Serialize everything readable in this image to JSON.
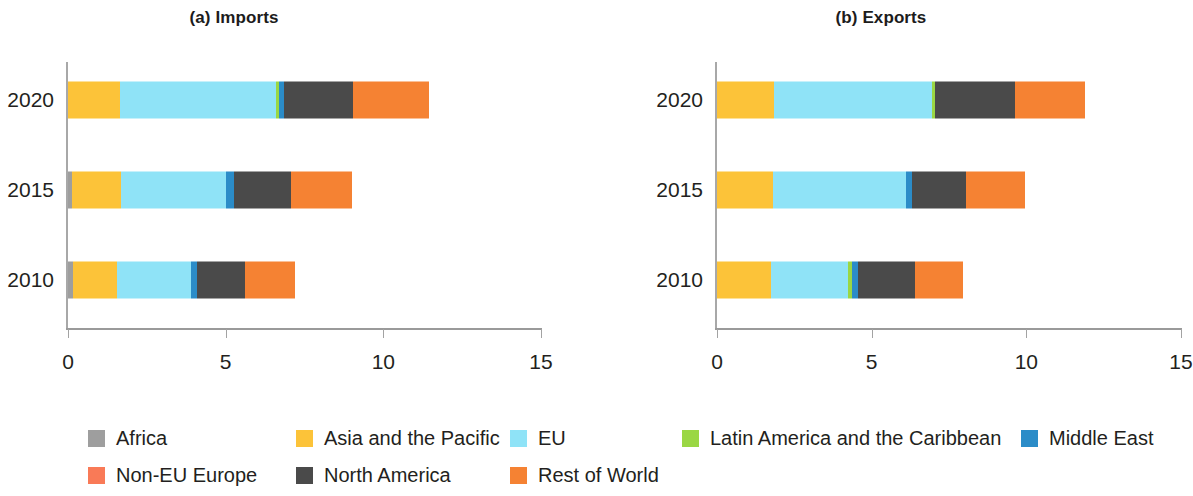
{
  "chart_data": {
    "type": "bar",
    "orientation": "horizontal",
    "stacked": true,
    "title": "",
    "panels": [
      {
        "id": "imports",
        "title": "(a) Imports",
        "xlabel": "",
        "ylabel": "",
        "xlim": [
          0,
          15
        ],
        "xticks": [
          0,
          5,
          10,
          15
        ],
        "xtick_labels": [
          "0",
          "5",
          "10",
          "15"
        ],
        "categories": [
          "2020",
          "2015",
          "2010"
        ],
        "grid": false,
        "series": [
          {
            "name": "Africa",
            "values": [
              0.0,
              0.12,
              0.15
            ]
          },
          {
            "name": "Asia and the Pacific",
            "values": [
              1.65,
              1.55,
              1.4
            ]
          },
          {
            "name": "EU",
            "values": [
              4.95,
              3.35,
              2.35
            ]
          },
          {
            "name": "Latin America and the Caribbean",
            "values": [
              0.1,
              0.0,
              0.0
            ]
          },
          {
            "name": "Middle East",
            "values": [
              0.15,
              0.25,
              0.2
            ]
          },
          {
            "name": "Non-EU Europe",
            "values": [
              0.0,
              0.0,
              0.0
            ]
          },
          {
            "name": "North America",
            "values": [
              2.2,
              1.8,
              1.5
            ]
          },
          {
            "name": "Rest of World",
            "values": [
              2.4,
              1.95,
              1.6
            ]
          }
        ],
        "totals": [
          11.45,
          9.02,
          7.2
        ]
      },
      {
        "id": "exports",
        "title": "(b) Exports",
        "xlabel": "",
        "ylabel": "",
        "xlim": [
          0,
          15
        ],
        "xticks": [
          0,
          5,
          10,
          15
        ],
        "xtick_labels": [
          "0",
          "5",
          "10",
          "15"
        ],
        "categories": [
          "2020",
          "2015",
          "2010"
        ],
        "grid": false,
        "series": [
          {
            "name": "Africa",
            "values": [
              0.0,
              0.0,
              0.0
            ]
          },
          {
            "name": "Asia and the Pacific",
            "values": [
              1.85,
              1.8,
              1.75
            ]
          },
          {
            "name": "EU",
            "values": [
              5.1,
              4.3,
              2.5
            ]
          },
          {
            "name": "Latin America and the Caribbean",
            "values": [
              0.1,
              0.0,
              0.1
            ]
          },
          {
            "name": "Middle East",
            "values": [
              0.0,
              0.2,
              0.2
            ]
          },
          {
            "name": "Non-EU Europe",
            "values": [
              0.0,
              0.0,
              0.0
            ]
          },
          {
            "name": "North America",
            "values": [
              2.6,
              1.75,
              1.85
            ]
          },
          {
            "name": "Rest of World",
            "values": [
              2.25,
              1.9,
              1.55
            ]
          }
        ],
        "totals": [
          11.9,
          9.95,
          7.95
        ]
      }
    ]
  },
  "legend": {
    "position": "bottom",
    "items": [
      {
        "label": "Africa",
        "color": "#9e9e9e"
      },
      {
        "label": "Asia and the Pacific",
        "color": "#fcc339"
      },
      {
        "label": "EU",
        "color": "#8fe3f7"
      },
      {
        "label": "Latin America and the Caribbean",
        "color": "#9ad744"
      },
      {
        "label": "Middle East",
        "color": "#2b8cc8"
      },
      {
        "label": "Non-EU Europe",
        "color": "#f97a57"
      },
      {
        "label": "North America",
        "color": "#4a4a4a"
      },
      {
        "label": "Rest of World",
        "color": "#f58233"
      }
    ]
  }
}
